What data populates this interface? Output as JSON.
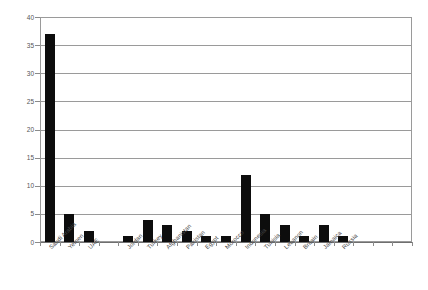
{
  "chart_data": {
    "type": "bar",
    "title": "",
    "subtitle": "",
    "xlabel": "",
    "ylabel": "",
    "ylim": [
      0,
      40
    ],
    "yticks": [
      0,
      5,
      10,
      15,
      20,
      25,
      30,
      35,
      40
    ],
    "grid": true,
    "legend": false,
    "bar_color": "#0d0d0d",
    "grid_color": "#9a9a9a",
    "axis_color": "#6f6f6f",
    "categories": [
      "Saudi Arabia",
      "Yemen",
      "UAE",
      "Jordan",
      "Turkey",
      "Afghanistan",
      "Pakistan",
      "Egypt",
      "Morocco",
      "Indonesia",
      "Tunisia",
      "Lebanon",
      "Britain",
      "Jamaica",
      "Russia"
    ],
    "values": [
      37,
      5,
      2,
      1,
      4,
      3,
      2,
      1,
      1,
      12,
      5,
      3,
      1,
      3,
      1
    ],
    "slots": 19,
    "slot_index": [
      0,
      1,
      2,
      4,
      5,
      6,
      7,
      8,
      9,
      10,
      11,
      12,
      13,
      14,
      15
    ]
  }
}
